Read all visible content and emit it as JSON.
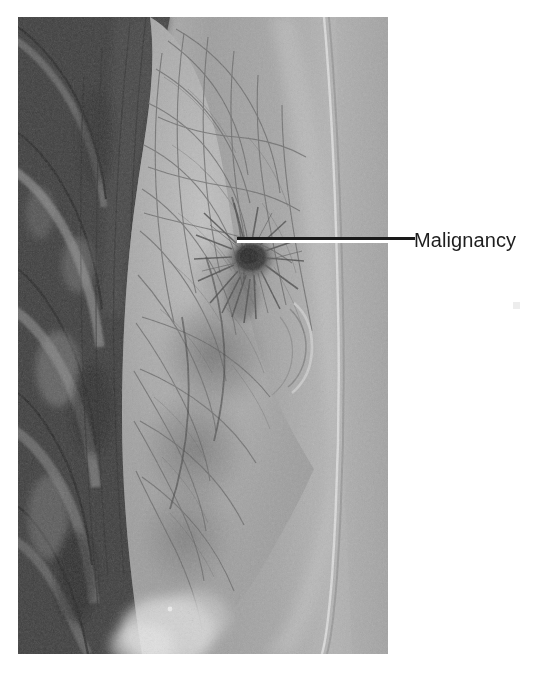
{
  "figure": {
    "type": "medical-radiograph",
    "modality": "mammogram",
    "view": "lateral",
    "plate": {
      "x": 18,
      "y": 17,
      "width": 370,
      "height": 637,
      "background_color": "#9a9a9a",
      "border": "none"
    },
    "regions": [
      {
        "name": "ribs-and-chest-wall",
        "description": "Dark diagonal rib shadows and chest wall along the left side of the plate",
        "tone": "dark"
      },
      {
        "name": "breast-parenchyma",
        "description": "Mid-gray fibroglandular tissue with fine trabecular and vascular markings",
        "tone": "mid"
      },
      {
        "name": "subcutaneous-fat-and-skin-line",
        "description": "Bright band with a thin skin edge along the anterior breast contour",
        "tone": "bright"
      },
      {
        "name": "background-air",
        "description": "Flat light-gray field anterior to the skin line",
        "tone": "light"
      }
    ]
  },
  "annotation": {
    "label": "Malignancy",
    "label_color": "#1e1e1e",
    "label_font_size_px": 20,
    "leader_line": {
      "name": "leader-line",
      "orientation": "horizontal",
      "stroke_color": "#1a1a1a",
      "halo_color": "#ffffff",
      "start_x": 237,
      "start_y": 238,
      "end_x": 415,
      "end_y": 238,
      "thickness_px": 3
    },
    "target": {
      "name": "spiculated-mass",
      "description": "Dense irregular spiculated mass with radiating strands in the upper-central breast",
      "center_x": 235,
      "center_y": 243
    }
  }
}
